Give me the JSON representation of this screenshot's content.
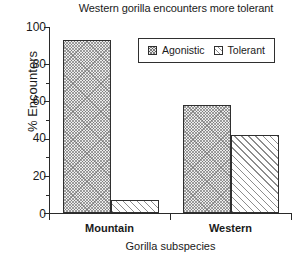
{
  "chart_data": {
    "type": "bar",
    "title": "Western gorilla encounters more tolerant",
    "xlabel": "Gorilla subspecies",
    "ylabel": "% Encounters",
    "categories": [
      "Mountain",
      "Western"
    ],
    "series": [
      {
        "name": "Agonistic",
        "values": [
          93,
          58
        ]
      },
      {
        "name": "Tolerant",
        "values": [
          7,
          42
        ]
      }
    ],
    "ylim": [
      0,
      100
    ],
    "yticks": [
      0,
      20,
      40,
      60,
      80,
      100
    ],
    "ytick_labels": [
      "0",
      "20",
      "40",
      "60",
      "80",
      "100"
    ],
    "yticks_minor": [
      10,
      30,
      50,
      70,
      90
    ],
    "grid": false,
    "legend_position": "upper center",
    "legend_entries": [
      "Agonistic",
      "Tolerant"
    ],
    "colors": {
      "axis": "#2a2a2a",
      "text": "#1a1a1a",
      "agonistic_fill": "#ececec",
      "tolerant_fill": "#ffffff",
      "bar_edge": "#2f2f2f",
      "background": "#ffffff"
    }
  },
  "yticks_rendered": [
    {
      "value": "100",
      "label": "100"
    },
    {
      "value": "80",
      "label": "80"
    },
    {
      "value": "60",
      "label": "60"
    },
    {
      "value": "40",
      "label": "40"
    },
    {
      "value": "20",
      "label": "20"
    },
    {
      "value": "0",
      "label": "0"
    }
  ]
}
